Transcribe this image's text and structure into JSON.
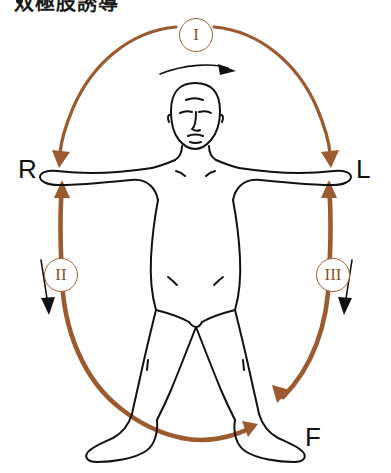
{
  "heading": {
    "bullet": "•",
    "text": "双極肢誘導"
  },
  "diagram": {
    "figure_name": "human-body-outline",
    "colors": {
      "lead_arc": "#9c5a2f",
      "lead_arc_dark": "#8c4f28",
      "body_outline": "#111111",
      "direction_arrow": "#111111",
      "background": "#ffffff"
    },
    "electrode_labels": [
      {
        "id": "R",
        "text": "R",
        "position": "left-hand",
        "meaning": "right-arm-electrode"
      },
      {
        "id": "L",
        "text": "L",
        "position": "right-hand",
        "meaning": "left-arm-electrode"
      },
      {
        "id": "F",
        "text": "F",
        "position": "bottom-right-foot",
        "meaning": "foot-electrode"
      }
    ],
    "leads": [
      {
        "id": "I",
        "label": "I",
        "badge_position": "top",
        "arc": "upper-ellipse",
        "direction": "R to L"
      },
      {
        "id": "II",
        "label": "II",
        "badge_position": "left",
        "arc": "left-ellipse",
        "direction": "R to F"
      },
      {
        "id": "III",
        "label": "III",
        "badge_position": "right",
        "arc": "right-ellipse",
        "direction": "L to F"
      }
    ],
    "direction_arrows": [
      {
        "name": "top-sweep-arrow",
        "orientation": "curved-right",
        "position": "below lead I badge"
      },
      {
        "name": "left-down-arrow",
        "orientation": "down",
        "position": "left of lead II badge"
      },
      {
        "name": "right-down-arrow",
        "orientation": "down",
        "position": "right of lead III badge"
      }
    ]
  }
}
